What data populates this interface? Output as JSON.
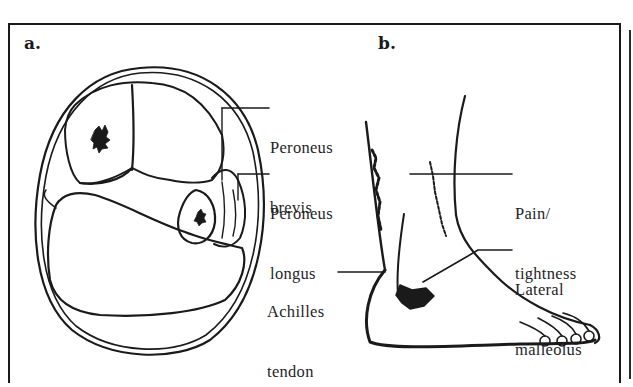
{
  "figure": {
    "panels": [
      {
        "id": "a",
        "label": "a.",
        "description": "Cross-section of lower leg",
        "callouts": [
          {
            "line1": "Peroneus",
            "line2": "brevis"
          },
          {
            "line1": "Peroneus",
            "line2": "longus"
          },
          {
            "line1": "Achilles",
            "line2": "tendon"
          }
        ]
      },
      {
        "id": "b",
        "label": "b.",
        "description": "Lateral view of ankle and foot",
        "callouts": [
          {
            "line1": "Pain/",
            "line2": "tightness"
          },
          {
            "line1": "Lateral",
            "line2": "malleolus"
          }
        ]
      }
    ],
    "colors": {
      "ink": "#1a1a1a",
      "background": "#ffffff"
    }
  }
}
